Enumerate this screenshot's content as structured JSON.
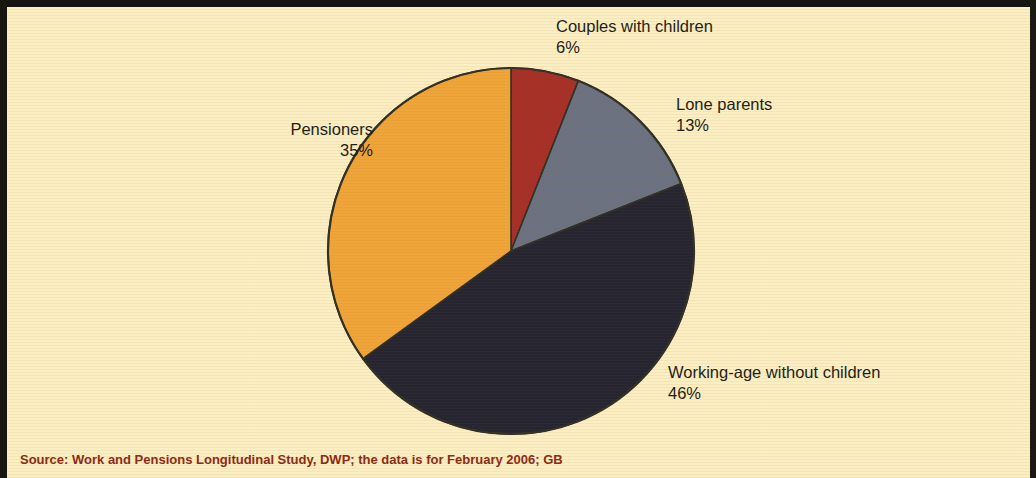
{
  "figure": {
    "background_color": "#faedc0",
    "border_color": "#141410",
    "source_note": "Source: Work and Pensions Longitudinal Study, DWP; the data is for February 2006; GB",
    "source_color": "#8d2b16"
  },
  "labels": {
    "couples": {
      "name": "Couples with children",
      "pct": "6%"
    },
    "lone": {
      "name": "Lone parents",
      "pct": "13%"
    },
    "working": {
      "name": "Working-age without children",
      "pct": "46%"
    },
    "pensioners": {
      "name": "Pensioners",
      "pct": "35%"
    }
  },
  "chart_data": {
    "type": "pie",
    "title": "",
    "subtitle": "",
    "xlabel": "",
    "ylabel": "",
    "legend_position": "none",
    "grid": false,
    "start_angle_deg": 0,
    "direction": "clockwise",
    "center_px": [
      511,
      251
    ],
    "radius_px": 183,
    "categories": [
      "Couples with children",
      "Lone parents",
      "Working-age without children",
      "Pensioners"
    ],
    "values": [
      6,
      13,
      46,
      35
    ],
    "value_labels": [
      "6%",
      "13%",
      "46%",
      "35%"
    ],
    "units": "percent",
    "colors": [
      "#9c1a14",
      "#5a6378",
      "#0d0d20",
      "#ed9b28"
    ],
    "slice_outline_color": "#1a1a14",
    "annotations": [
      "Source: Work and Pensions Longitudinal Study, DWP; the data is for February 2006; GB"
    ]
  }
}
